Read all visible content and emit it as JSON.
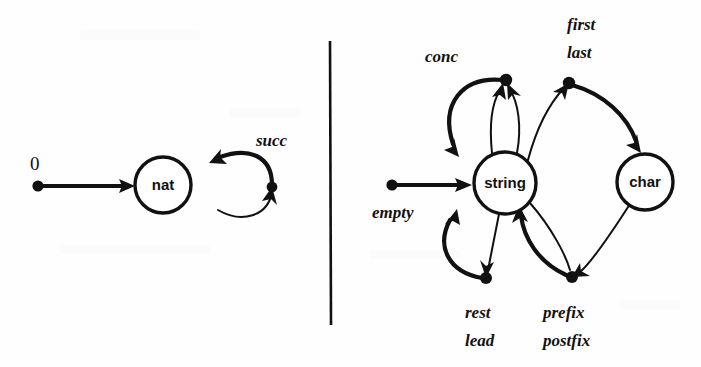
{
  "figure": {
    "background_color": "#fefefe",
    "ink_color": "#111111",
    "divider": {
      "name": "vertical-rule",
      "x": 330,
      "y1": 41,
      "y2": 325
    }
  },
  "left_panel": {
    "name": "nat-signature-graph",
    "nodes": [
      {
        "id": "nat",
        "label": "nat",
        "cx": 163,
        "cy": 185,
        "r": 28
      }
    ],
    "constants": [
      {
        "id": "zero",
        "label": "0",
        "label_x": 30,
        "label_y": 170,
        "dot_x": 38,
        "dot_y": 186,
        "target": "nat"
      }
    ],
    "operations": [
      {
        "id": "succ",
        "label": "succ",
        "label_x": 256,
        "label_y": 146,
        "source": "nat",
        "target": "nat",
        "tentacle_dot_x": 272,
        "tentacle_dot_y": 187
      }
    ]
  },
  "right_panel": {
    "name": "string-char-signature-graph",
    "nodes": [
      {
        "id": "string",
        "label": "string",
        "cx": 505,
        "cy": 183,
        "r": 31
      },
      {
        "id": "char",
        "label": "char",
        "cx": 645,
        "cy": 182,
        "r": 28
      }
    ],
    "constants": [
      {
        "id": "empty",
        "label": "empty",
        "label_x": 372,
        "label_y": 218,
        "dot_x": 392,
        "dot_y": 185,
        "target": "string"
      }
    ],
    "operations": [
      {
        "id": "conc",
        "label": "conc",
        "label_x": 425,
        "label_y": 62,
        "arity": 2,
        "sources": [
          "string",
          "string"
        ],
        "target": "string",
        "tentacle_dot_x": 506,
        "tentacle_dot_y": 80
      },
      {
        "id": "first-last",
        "labels": [
          "first",
          "last"
        ],
        "label_x": 567,
        "label_y_first": 30,
        "label_y_last": 58,
        "sources": [
          "string"
        ],
        "target": "char",
        "tentacle_dot_x": 569,
        "tentacle_dot_y": 83
      },
      {
        "id": "rest-lead",
        "labels": [
          "rest",
          "lead"
        ],
        "label_x": 465,
        "label_y_first": 318,
        "label_y_last": 346,
        "sources": [
          "string"
        ],
        "target": "string",
        "tentacle_dot_x": 486,
        "tentacle_dot_y": 278
      },
      {
        "id": "prefix-postfix",
        "labels": [
          "prefix",
          "postfix"
        ],
        "label_x": 543,
        "label_y_first": 318,
        "label_y_last": 346,
        "sources": [
          "string",
          "char"
        ],
        "target": "string",
        "tentacle_dot_x": 572,
        "tentacle_dot_y": 277
      }
    ]
  },
  "labels": {
    "zero": "0",
    "succ": "succ",
    "nat": "nat",
    "empty": "empty",
    "conc": "conc",
    "first": "first",
    "last": "last",
    "rest": "rest",
    "lead": "lead",
    "prefix": "prefix",
    "postfix": "postfix",
    "string": "string",
    "char": "char"
  }
}
